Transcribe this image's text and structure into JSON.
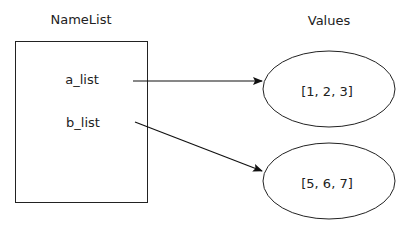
{
  "namelist": {
    "title": "NameList",
    "names": [
      "a_list",
      "b_list"
    ]
  },
  "values": {
    "title": "Values",
    "items": [
      "[1, 2, 3]",
      "[5, 6, 7]"
    ]
  },
  "arrows": [
    {
      "from": "a_list",
      "to": "[1, 2, 3]"
    },
    {
      "from": "b_list",
      "to": "[5, 6, 7]"
    }
  ]
}
